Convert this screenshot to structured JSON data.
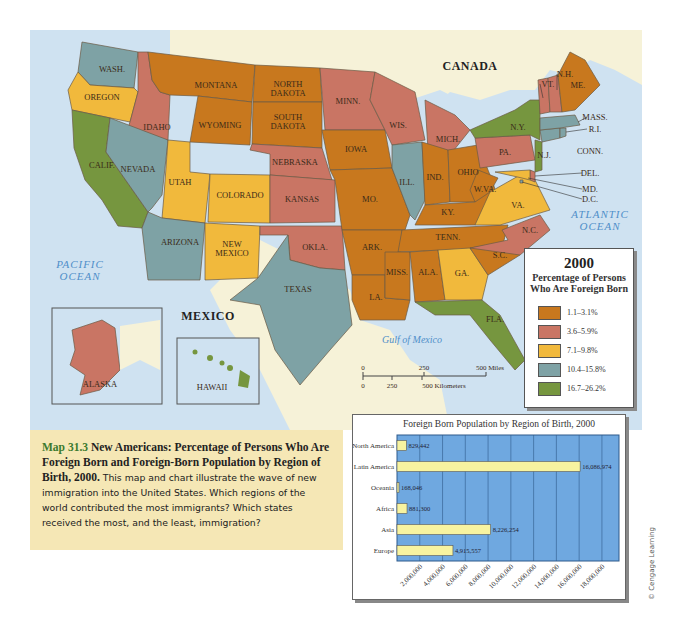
{
  "map": {
    "labels": {
      "canada": "CANADA",
      "mexico": "MEXICO",
      "pacific_ocean": [
        "PACIFIC",
        "OCEAN"
      ],
      "atlantic_ocean": [
        "ATLANTIC",
        "OCEAN"
      ],
      "gulf": "Gulf of Mexico"
    },
    "states": [
      {
        "id": "wa",
        "label": "WASH.",
        "category": 4
      },
      {
        "id": "or",
        "label": "OREGON",
        "category": 3
      },
      {
        "id": "ca",
        "label": "CALIF.",
        "category": 5
      },
      {
        "id": "id",
        "label": "IDAHO",
        "category": 2
      },
      {
        "id": "nv",
        "label": "NEVADA",
        "category": 4
      },
      {
        "id": "mt",
        "label": "MONTANA",
        "category": 1
      },
      {
        "id": "wy",
        "label": "WYOMING",
        "category": 1
      },
      {
        "id": "ut",
        "label": "UTAH",
        "category": 3
      },
      {
        "id": "co",
        "label": "COLORADO",
        "category": 3
      },
      {
        "id": "az",
        "label": "ARIZONA",
        "category": 4
      },
      {
        "id": "nm",
        "label": "NEW MEXICO",
        "category": 3
      },
      {
        "id": "nd",
        "label": "NORTH DAKOTA",
        "category": 1
      },
      {
        "id": "sd",
        "label": "SOUTH DAKOTA",
        "category": 1
      },
      {
        "id": "ne",
        "label": "NEBRASKA",
        "category": 2
      },
      {
        "id": "ks",
        "label": "KANSAS",
        "category": 2
      },
      {
        "id": "ok",
        "label": "OKLA.",
        "category": 2
      },
      {
        "id": "tx",
        "label": "TEXAS",
        "category": 4
      },
      {
        "id": "mn",
        "label": "MINN.",
        "category": 2
      },
      {
        "id": "ia",
        "label": "IOWA",
        "category": 1
      },
      {
        "id": "mo",
        "label": "MO.",
        "category": 1
      },
      {
        "id": "ar",
        "label": "ARK.",
        "category": 1
      },
      {
        "id": "la",
        "label": "LA.",
        "category": 1
      },
      {
        "id": "wi",
        "label": "WIS.",
        "category": 2
      },
      {
        "id": "il",
        "label": "ILL.",
        "category": 4
      },
      {
        "id": "mi",
        "label": "MICH.",
        "category": 2
      },
      {
        "id": "in",
        "label": "IND.",
        "category": 1
      },
      {
        "id": "oh",
        "label": "OHIO",
        "category": 1
      },
      {
        "id": "ky",
        "label": "KY.",
        "category": 1
      },
      {
        "id": "tn",
        "label": "TENN.",
        "category": 1
      },
      {
        "id": "ms",
        "label": "MISS.",
        "category": 1
      },
      {
        "id": "al",
        "label": "ALA.",
        "category": 1
      },
      {
        "id": "ga",
        "label": "GA.",
        "category": 3
      },
      {
        "id": "fl",
        "label": "FLA.",
        "category": 5
      },
      {
        "id": "sc",
        "label": "S.C.",
        "category": 1
      },
      {
        "id": "nc",
        "label": "N.C.",
        "category": 2
      },
      {
        "id": "va",
        "label": "VA.",
        "category": 3
      },
      {
        "id": "wv",
        "label": "W.VA.",
        "category": 1
      },
      {
        "id": "pa",
        "label": "PA.",
        "category": 2
      },
      {
        "id": "ny",
        "label": "N.Y.",
        "category": 5
      },
      {
        "id": "nj",
        "label": "N.J.",
        "category": 5
      },
      {
        "id": "de",
        "label": "DEL.",
        "category": 2
      },
      {
        "id": "md",
        "label": "MD.",
        "category": 3
      },
      {
        "id": "dc",
        "label": "D.C.",
        "category": 4
      },
      {
        "id": "ct",
        "label": "CONN.",
        "category": 4
      },
      {
        "id": "ri",
        "label": "R.I.",
        "category": 4
      },
      {
        "id": "ma",
        "label": "MASS.",
        "category": 4
      },
      {
        "id": "vt",
        "label": "VT.",
        "category": 2
      },
      {
        "id": "nh",
        "label": "N.H.",
        "category": 2
      },
      {
        "id": "me",
        "label": "ME.",
        "category": 1
      },
      {
        "id": "ak",
        "label": "ALASKA",
        "category": 2
      },
      {
        "id": "hi",
        "label": "HAWAII",
        "category": 5
      }
    ],
    "scale": {
      "miles": [
        "0",
        "250",
        "500 Miles"
      ],
      "km": [
        "0",
        "250",
        "500 Kilometers"
      ]
    }
  },
  "legend": {
    "year": "2000",
    "subtitle_lines": [
      "Percentage of Persons",
      "Who Are Foreign Born"
    ],
    "categories": [
      {
        "id": 1,
        "label": "1.1–3.1%",
        "color": "#c8781e"
      },
      {
        "id": 2,
        "label": "3.6–5.9%",
        "color": "#c97564"
      },
      {
        "id": 3,
        "label": "7.1–9.8%",
        "color": "#f1b93c"
      },
      {
        "id": 4,
        "label": "10.4–15.8%",
        "color": "#7ea2a5"
      },
      {
        "id": 5,
        "label": "16.7–26.2%",
        "color": "#76963f"
      }
    ]
  },
  "caption": {
    "number": "Map 31.3",
    "title": "New Americans: Percentage of Persons Who Are Foreign Born and Foreign-Born Population by Region of Birth, 2000.",
    "body": "This map and chart illustrate the wave of new immigration into the United States. Which regions of the world contributed the most immigrants? Which states received the most, and the least, immigration?"
  },
  "chart_data": {
    "type": "bar",
    "orientation": "horizontal",
    "title": "Foreign Born Population by Region of Birth, 2000",
    "categories": [
      "North America",
      "Latin America",
      "Oceania",
      "Africa",
      "Asia",
      "Europe"
    ],
    "values": [
      829442,
      16086974,
      168046,
      881300,
      8226254,
      4915557
    ],
    "value_labels": [
      "829,442",
      "16,086,974",
      "168,046",
      "881,300",
      "8,226,254",
      "4,915,557"
    ],
    "xlabel": "",
    "ylabel": "",
    "xlim": [
      0,
      19500000
    ],
    "xticks": [
      2000000,
      4000000,
      6000000,
      8000000,
      10000000,
      12000000,
      14000000,
      16000000,
      18000000
    ],
    "xtick_labels": [
      "2,000,000",
      "4,000,000",
      "6,000,000",
      "8,000,000",
      "10,000,000",
      "12,000,000",
      "14,000,000",
      "16,000,000",
      "18,000,000"
    ],
    "grid": true,
    "colors": {
      "plot_bg": "#6fa8e0",
      "bar": "#f7f3a0",
      "grid": "#2f5b8c"
    }
  },
  "credit": "© Cengage Learning"
}
